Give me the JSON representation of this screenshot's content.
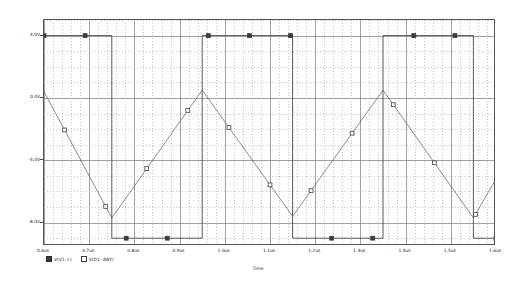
{
  "window": {
    "app": "PSpice A/D Probe waveform viewer",
    "background": "#ffffff"
  },
  "plot": {
    "frame_color": "#555555",
    "grid_major_color": "#8a8a8a",
    "grid_minor_color": "#bdbdbd",
    "trace1_color": "#3c3c3c",
    "trace2_color": "#555555"
  },
  "axes": {
    "x_title": "Time",
    "y_ticks": [
      "4.0V",
      "0.0V",
      "-4.0V",
      "-8.0V"
    ],
    "x_ticks": [
      "0.6us",
      "0.65us",
      "0.7us",
      "0.75us",
      "0.8us",
      "0.85us",
      "0.9us",
      "0.95us",
      "1.0us",
      "1.05us",
      "1.1us",
      "1.15us",
      "1.2us",
      "1.25us",
      "1.3us",
      "1.35us",
      "1.4us",
      "1.45us",
      "1.5us",
      "1.55us",
      "1.6us"
    ],
    "x_tick_labels_shown": [
      "0.6us",
      "0.7us",
      "0.8us",
      "0.9us",
      "1.0us",
      "1.1us",
      "1.2us",
      "1.3us",
      "1.4us",
      "1.5us",
      "1.6us"
    ]
  },
  "legend": {
    "entries": [
      {
        "symbol": "filled-square",
        "label": "V(V1:+)"
      },
      {
        "symbol": "hollow-square",
        "label": "V(D1:-ANY)"
      }
    ]
  },
  "chart_data": {
    "type": "line",
    "title": "",
    "xlabel": "Time",
    "ylabel": "",
    "xlim": [
      0.6,
      1.6
    ],
    "ylim": [
      -9.5,
      5.0
    ],
    "xunit": "us",
    "yunit": "V",
    "grid": true,
    "legend_position": "bottom-left",
    "xticks": [
      0.6,
      0.7,
      0.8,
      0.9,
      1.0,
      1.1,
      1.2,
      1.3,
      1.4,
      1.5,
      1.6
    ],
    "xticklabels": [
      "0.6us",
      "0.7us",
      "0.8us",
      "0.9us",
      "1.0us",
      "1.1us",
      "1.2us",
      "1.3us",
      "1.4us",
      "1.5us",
      "1.6us"
    ],
    "yticks": [
      4.0,
      0.0,
      -4.0,
      -8.0
    ],
    "yticklabels": [
      "4.0V",
      "0.0V",
      "-4.0V",
      "-8.0V"
    ],
    "series": [
      {
        "name": "V(V1:+)",
        "marker": "filled-square",
        "description": "square wave, period 0.4us, high 4.0V, low -9.0V",
        "x": [
          0.6,
          0.75,
          0.75,
          0.95,
          0.95,
          1.15,
          1.15,
          1.35,
          1.35,
          1.55,
          1.55,
          1.6
        ],
        "y": [
          4.0,
          4.0,
          -9.0,
          -9.0,
          4.0,
          4.0,
          -9.0,
          -9.0,
          4.0,
          4.0,
          -9.0,
          -9.0
        ]
      },
      {
        "name": "V(D1:-ANY)",
        "marker": "hollow-square",
        "description": "triangle wave, period 0.4us, peak 0.5V, trough -7.7V",
        "x": [
          0.6,
          0.75,
          0.95,
          1.15,
          1.35,
          1.55,
          1.6
        ],
        "y": [
          0.4,
          -7.7,
          0.5,
          -7.6,
          0.5,
          -7.7,
          -5.2
        ]
      }
    ]
  }
}
